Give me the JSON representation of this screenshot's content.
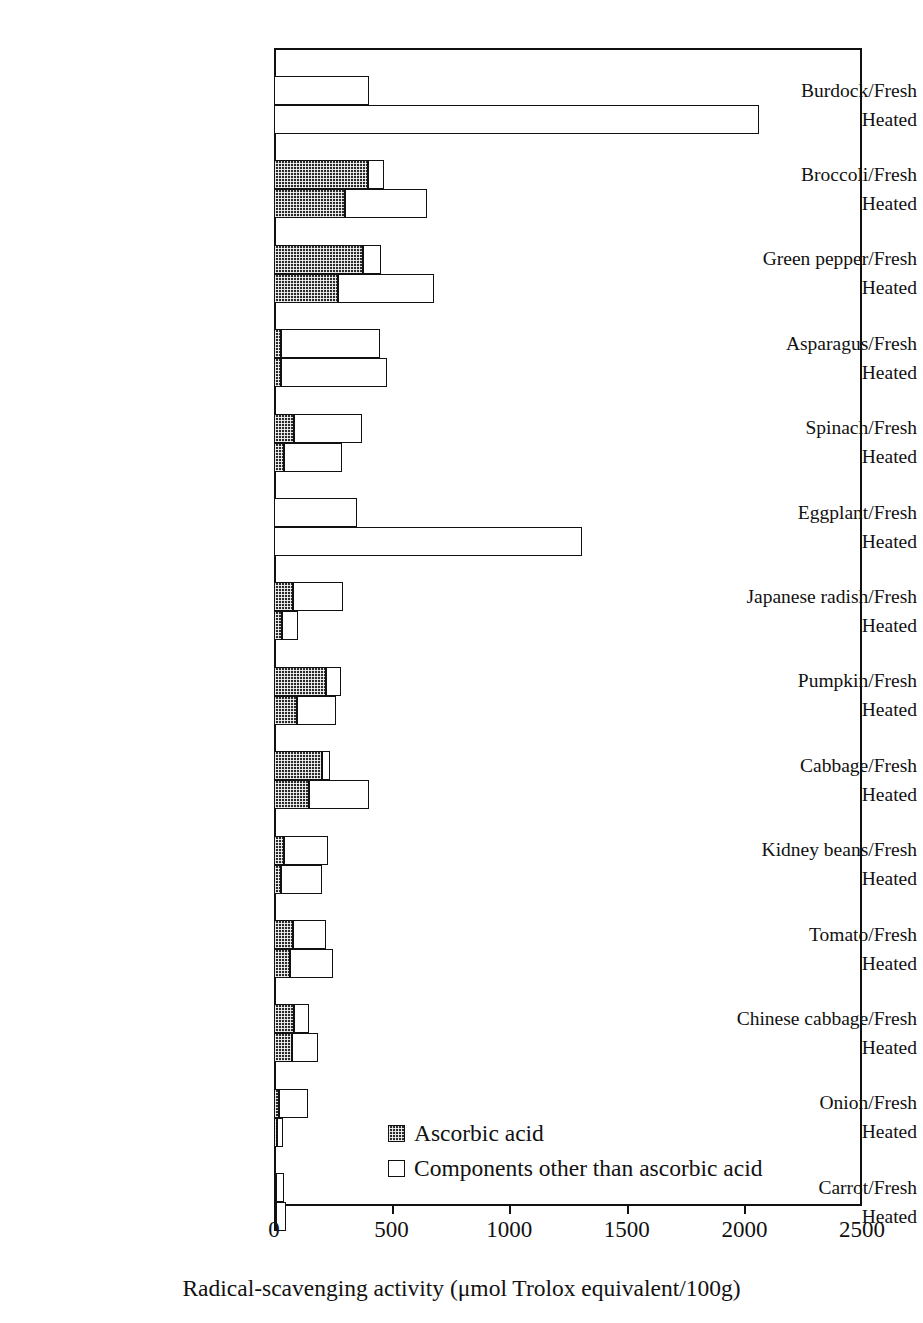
{
  "chart_data": {
    "type": "bar",
    "orientation": "horizontal",
    "stacked": true,
    "title": "",
    "xlabel": "Radical-scavenging activity (μmol Trolox equivalent/100g)",
    "ylabel": "",
    "xlim": [
      0,
      2500
    ],
    "xticks": [
      0,
      500,
      1000,
      1500,
      2000,
      2500
    ],
    "xtick_labels": [
      "0",
      "500",
      "1000",
      "1500",
      "2000",
      "2500"
    ],
    "grid": false,
    "legend_position": "inside-bottom-center",
    "series": [
      {
        "name": "Ascorbic acid",
        "style": "dark-hatched"
      },
      {
        "name": "Components other than ascorbic acid",
        "style": "white-outline"
      }
    ],
    "legend": [
      "Ascorbic acid",
      "Components other than ascorbic acid"
    ],
    "groups": [
      {
        "name": "Burdock",
        "label_fresh": "Burdock/Fresh",
        "label_heated": "Heated",
        "fresh": {
          "ascorbic": 0,
          "other": 403,
          "total": 403
        },
        "heated": {
          "ascorbic": 0,
          "other": 2060,
          "total": 2060
        }
      },
      {
        "name": "Broccoli",
        "label_fresh": "Broccoli/Fresh",
        "label_heated": "Heated",
        "fresh": {
          "ascorbic": 400,
          "other": 68,
          "total": 468
        },
        "heated": {
          "ascorbic": 302,
          "other": 349,
          "total": 651
        }
      },
      {
        "name": "Green pepper",
        "label_fresh": "Green pepper/Fresh",
        "label_heated": "Heated",
        "fresh": {
          "ascorbic": 378,
          "other": 77,
          "total": 455
        },
        "heated": {
          "ascorbic": 272,
          "other": 408,
          "total": 680
        }
      },
      {
        "name": "Asparagus",
        "label_fresh": "Asparagus/Fresh",
        "label_heated": "Heated",
        "fresh": {
          "ascorbic": 30,
          "other": 421,
          "total": 451
        },
        "heated": {
          "ascorbic": 30,
          "other": 450,
          "total": 480
        }
      },
      {
        "name": "Spinach",
        "label_fresh": "Spinach/Fresh",
        "label_heated": "Heated",
        "fresh": {
          "ascorbic": 85,
          "other": 290,
          "total": 375
        },
        "heated": {
          "ascorbic": 43,
          "other": 246,
          "total": 289
        }
      },
      {
        "name": "Eggplant",
        "label_fresh": "Eggplant/Fresh",
        "label_heated": "Heated",
        "fresh": {
          "ascorbic": 0,
          "other": 352,
          "total": 352
        },
        "heated": {
          "ascorbic": 0,
          "other": 1310,
          "total": 1310
        }
      },
      {
        "name": "Japanese radish",
        "label_fresh": "Japanese radish/Fresh",
        "label_heated": "Heated",
        "fresh": {
          "ascorbic": 82,
          "other": 213,
          "total": 295
        },
        "heated": {
          "ascorbic": 35,
          "other": 68,
          "total": 103
        }
      },
      {
        "name": "Pumpkin",
        "label_fresh": "Pumpkin/Fresh",
        "label_heated": "Heated",
        "fresh": {
          "ascorbic": 221,
          "other": 64,
          "total": 285
        },
        "heated": {
          "ascorbic": 98,
          "other": 165,
          "total": 263
        }
      },
      {
        "name": "Cabbage",
        "label_fresh": "Cabbage/Fresh",
        "label_heated": "Heated",
        "fresh": {
          "ascorbic": 204,
          "other": 35,
          "total": 239
        },
        "heated": {
          "ascorbic": 150,
          "other": 254,
          "total": 404
        }
      },
      {
        "name": "Kidney beans",
        "label_fresh": "Kidney beans/Fresh",
        "label_heated": "Heated",
        "fresh": {
          "ascorbic": 44,
          "other": 186,
          "total": 230
        },
        "heated": {
          "ascorbic": 30,
          "other": 175,
          "total": 205
        }
      },
      {
        "name": "Tomato",
        "label_fresh": "Tomato/Fresh",
        "label_heated": "Heated",
        "fresh": {
          "ascorbic": 81,
          "other": 140,
          "total": 221
        },
        "heated": {
          "ascorbic": 67,
          "other": 185,
          "total": 252
        }
      },
      {
        "name": "Chinese cabbage",
        "label_fresh": "Chinese cabbage/Fresh",
        "label_heated": "Heated",
        "fresh": {
          "ascorbic": 86,
          "other": 62,
          "total": 148
        },
        "heated": {
          "ascorbic": 76,
          "other": 112,
          "total": 188
        }
      },
      {
        "name": "Onion",
        "label_fresh": "Onion/Fresh",
        "label_heated": "Heated",
        "fresh": {
          "ascorbic": 20,
          "other": 123,
          "total": 143
        },
        "heated": {
          "ascorbic": 12,
          "other": 28,
          "total": 40
        }
      },
      {
        "name": "Carrot",
        "label_fresh": "Carrot/Fresh",
        "label_heated": "Heated",
        "fresh": {
          "ascorbic": 10,
          "other": 32,
          "total": 42
        },
        "heated": {
          "ascorbic": 8,
          "other": 42,
          "total": 50
        }
      }
    ]
  },
  "colors": {
    "ascorbic": "#2a2a2a",
    "other": "#ffffff",
    "outline": "#111111",
    "background": "#ffffff"
  }
}
